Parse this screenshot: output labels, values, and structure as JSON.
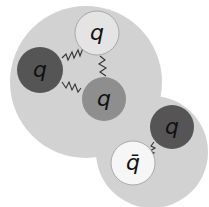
{
  "diagram": {
    "colors": {
      "background": "#ffffff",
      "hadron_fill": "#d2d2d2",
      "quark_light": "#e4e4e4",
      "quark_dark": "#555555",
      "quark_medium": "#8e8e8e",
      "antiquark": "#f6f6f6",
      "gluon": "#333333",
      "outline": "#9a9a9a"
    },
    "baryon": {
      "label": "baryon",
      "quarks": [
        {
          "id": "q1",
          "label": "q",
          "shade": "light"
        },
        {
          "id": "q2",
          "label": "q",
          "shade": "dark"
        },
        {
          "id": "q3",
          "label": "q",
          "shade": "medium"
        }
      ]
    },
    "meson": {
      "label": "meson",
      "quarks": [
        {
          "id": "q4",
          "label": "q",
          "shade": "dark"
        },
        {
          "id": "q5",
          "label": "q̄",
          "shade": "white",
          "antiquark": true
        }
      ]
    },
    "gluons": [
      {
        "from": "q2",
        "to": "q1"
      },
      {
        "from": "q1",
        "to": "q3"
      },
      {
        "from": "q2",
        "to": "q3"
      },
      {
        "from": "q4",
        "to": "q5"
      }
    ]
  }
}
